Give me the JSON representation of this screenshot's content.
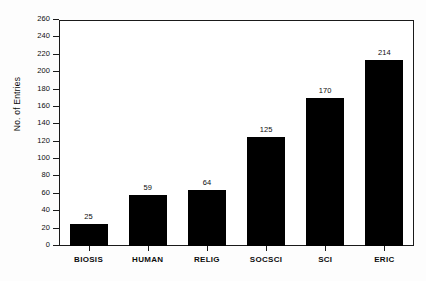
{
  "chart_data": {
    "type": "bar",
    "title": "",
    "subtitle": "",
    "xlabel": "",
    "ylabel": "No. of Entries",
    "categories": [
      "BIOSIS",
      "HUMAN",
      "RELIG",
      "SOCSCI",
      "SCI",
      "ERIC"
    ],
    "values": [
      25,
      59,
      64,
      125,
      170,
      214
    ],
    "value_labels": [
      "25",
      "59",
      "64",
      "125",
      "170",
      "214"
    ],
    "ylim": [
      0,
      260
    ],
    "ytick_step": 20,
    "yticks": [
      0,
      20,
      40,
      60,
      80,
      100,
      120,
      140,
      160,
      180,
      200,
      220,
      240,
      260
    ],
    "ytick_labels": [
      "0",
      "20",
      "40",
      "60",
      "80",
      "100",
      "120",
      "140",
      "160",
      "180",
      "200",
      "220",
      "240",
      "260"
    ],
    "grid": false,
    "legend": null,
    "bar_color": "#000000",
    "axis_color": "#1a1a1a",
    "background_color": "#ffffff"
  }
}
